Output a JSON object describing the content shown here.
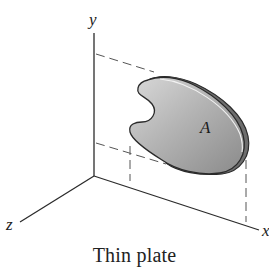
{
  "figure": {
    "caption": "Thin plate",
    "axes": {
      "x_label": "x",
      "y_label": "y",
      "z_label": "z"
    },
    "plate": {
      "label": "A",
      "fill_light": "#d6d6d6",
      "fill_dark": "#8f8f8f",
      "edge_color": "#2a2a2a"
    },
    "line_color": "#2b2b2b",
    "dash_color": "#555555"
  }
}
